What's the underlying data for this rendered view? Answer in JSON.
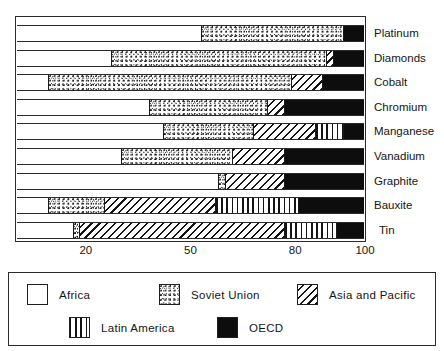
{
  "chart_data": {
    "type": "bar",
    "orientation": "horizontal",
    "stacked": true,
    "title": "",
    "subtitle": "",
    "xlabel": "",
    "ylabel": "",
    "xlim": [
      0,
      100
    ],
    "grid": false,
    "legend_position": "bottom",
    "xticks": [
      {
        "label": "20",
        "value": 20
      },
      {
        "label": "50",
        "value": 50
      },
      {
        "label": "80",
        "value": 80
      },
      {
        "label": "100",
        "value": 100
      }
    ],
    "categories": [
      "Platinum",
      "Diamonds",
      "Cobalt",
      "Chromium",
      "Manganese",
      "Vanadium",
      "Graphite",
      "Bauxite",
      "Tin"
    ],
    "series": [
      {
        "name": "Africa",
        "pattern": "solid-white",
        "color": "#ffffff",
        "values": [
          53,
          27,
          9,
          38,
          42,
          30,
          58,
          9,
          16
        ]
      },
      {
        "name": "Soviet Union",
        "pattern": "stipple-dots",
        "color": "#ffffff",
        "values": [
          41,
          62,
          70,
          34,
          26,
          32,
          2,
          16,
          2
        ]
      },
      {
        "name": "Asia and Pacific",
        "pattern": "diagonal-hatch",
        "color": "#ffffff",
        "values": [
          0,
          2,
          9,
          5,
          18,
          15,
          17,
          32,
          59
        ]
      },
      {
        "name": "Latin America",
        "pattern": "vertical-hatch",
        "color": "#ffffff",
        "values": [
          0,
          0,
          0,
          0,
          8,
          0,
          0,
          24,
          15
        ]
      },
      {
        "name": "OECD",
        "pattern": "solid-black",
        "color": "#0d0d0d",
        "values": [
          6,
          9,
          12,
          23,
          6,
          23,
          23,
          19,
          8
        ]
      }
    ]
  },
  "axis": {
    "ticks": [
      "20",
      "50",
      "80",
      "100"
    ]
  },
  "category_labels": [
    "Platinum",
    "Diamonds",
    "Cobalt",
    "Chromium",
    "Manganese",
    "Vanadium",
    "Graphite",
    "Bauxite",
    "Tin"
  ],
  "legend": {
    "items": [
      {
        "label": "Africa",
        "pattern": "solid-white"
      },
      {
        "label": "Soviet Union",
        "pattern": "stipple-dots"
      },
      {
        "label": "Asia and Pacific",
        "pattern": "diagonal-hatch"
      },
      {
        "label": "Latin America",
        "pattern": "vertical-hatch"
      },
      {
        "label": "OECD",
        "pattern": "solid-black"
      }
    ]
  }
}
